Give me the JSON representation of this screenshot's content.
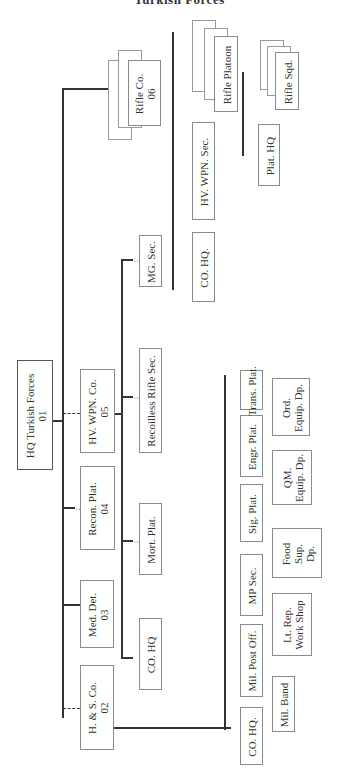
{
  "title": "Turkish Forces",
  "hq": {
    "label": "HQ Turkish Forces",
    "code": "01"
  },
  "units": [
    {
      "label": "H. & S. Co.",
      "code": "02"
    },
    {
      "label": "Med. Det.",
      "code": "03"
    },
    {
      "label": "Recon. Plat.",
      "code": "04"
    },
    {
      "label": "HV. WPN. Co.",
      "code": "05"
    },
    {
      "label": "Rifle Co.",
      "code": "06"
    }
  ],
  "hv_wpn_co_children": [
    "Mort. Plat.",
    "Recoilless Rifle Sec.",
    "MG. Sec."
  ],
  "hs_co_children": [
    "Mil. HQ.",
    "CO. HQ.",
    "Mil. Post Off.",
    "MP Sec.",
    "Sig. Plat.",
    "Engr. Plat.",
    "Trans. Plat."
  ],
  "hs_co_children_upper": [
    "CO. HQ.",
    "Mil. Post Off.",
    "MP Sec.",
    "Sig. Plat.",
    "Engr. Plat.",
    "Trans. Plat."
  ],
  "hs_co_children_lower": [
    "Mil. Band",
    "Lt. Rep. Work Shop",
    "Food Sup. Dp.",
    "QM. Equip. Dp.",
    "Ord. Equip. Dp."
  ],
  "lower": {
    "mil_band": "Mil. Band",
    "lt_rep": [
      "Lt. Rep.",
      "Work Shop"
    ],
    "food": [
      "Food",
      "Sup.",
      "Dp."
    ],
    "qm": [
      "QM.",
      "Equip. Dp."
    ],
    "ord": [
      "Ord.",
      "Equip. Dp."
    ]
  },
  "recon_children": [
    "CO. HQ"
  ],
  "rifle_co_children": [
    "CO. HQ.",
    "HV. WPN. Sec.",
    "Rifle Platoon"
  ],
  "rifle_platoon_children": [
    "Plat. HQ",
    "Rifle Sqd."
  ]
}
